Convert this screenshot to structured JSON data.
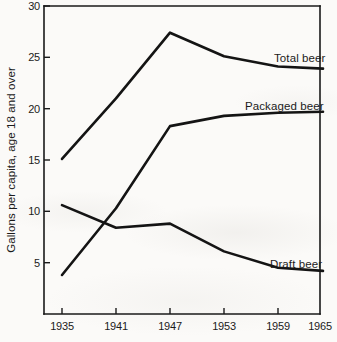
{
  "chart_data": {
    "type": "line",
    "title": "",
    "xlabel": "",
    "ylabel": "Gallons per capita, age 18 and over",
    "xlim": [
      1935,
      1965
    ],
    "ylim": [
      0,
      30
    ],
    "grid": false,
    "legend_position": "inline-right-of-line-ends",
    "x_ticks": [
      "1935",
      "1941",
      "1947",
      "1953",
      "1959",
      "1965"
    ],
    "y_ticks": [
      "5",
      "10",
      "15",
      "20",
      "25",
      "30"
    ],
    "x": [
      1935,
      1941,
      1947,
      1953,
      1959,
      1964
    ],
    "series": [
      {
        "name": "Total beer",
        "label": "Total beer",
        "values": [
          15.1,
          21.0,
          27.4,
          25.1,
          24.1,
          23.9
        ]
      },
      {
        "name": "Packaged beer",
        "label": "Packaged beer",
        "values": [
          3.8,
          10.3,
          18.3,
          19.3,
          19.6,
          19.7
        ]
      },
      {
        "name": "Draft beer",
        "label": "Draft beer",
        "values": [
          10.6,
          8.4,
          8.8,
          6.1,
          4.5,
          4.2
        ]
      }
    ],
    "annotations": [
      {
        "text": "Total beer",
        "x": 1958.0,
        "y": 25.2
      },
      {
        "text": "Packaged beer",
        "x": 1955.3,
        "y": 20.9
      },
      {
        "text": "Draft beer",
        "x": 1958.0,
        "y": 5.3
      }
    ]
  },
  "colors": {
    "line": "#141414",
    "axis": "#1a1a1a",
    "text": "#1b1b1b",
    "background": "#fbfaf8"
  }
}
